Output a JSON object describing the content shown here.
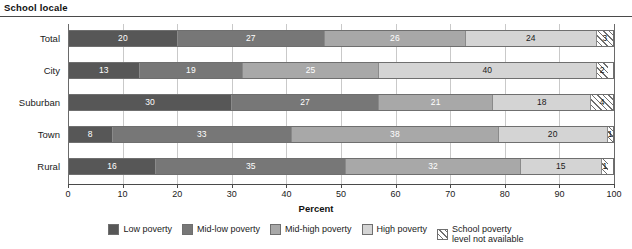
{
  "header": {
    "title": "School locale"
  },
  "chart_data": {
    "type": "bar",
    "orientation": "horizontal",
    "stacked": true,
    "stack_total": 100,
    "title": "School locale",
    "xlabel": "Percent",
    "ylabel": "",
    "xlim": [
      0,
      100
    ],
    "xticks": [
      "0",
      "10",
      "20",
      "30",
      "40",
      "50",
      "60",
      "70",
      "80",
      "90",
      "100"
    ],
    "grid": "vertical",
    "legend_position": "bottom",
    "categories": [
      "Total",
      "City",
      "Suburban",
      "Town",
      "Rural"
    ],
    "series": [
      {
        "name": "Low poverty",
        "color": "#575757",
        "values": [
          20,
          13,
          30,
          8,
          16
        ]
      },
      {
        "name": "Mid-low poverty",
        "color": "#777777",
        "values": [
          27,
          19,
          27,
          33,
          35
        ]
      },
      {
        "name": "Mid-high poverty",
        "color": "#a8a8a8",
        "values": [
          26,
          25,
          21,
          38,
          32
        ]
      },
      {
        "name": "High poverty",
        "color": "#d4d4d4",
        "values": [
          24,
          40,
          18,
          20,
          15
        ]
      },
      {
        "name": "School poverty level not available",
        "color": "#ffffff",
        "pattern": "diagonal-hatch",
        "values": [
          3,
          2,
          4,
          1,
          1
        ]
      }
    ],
    "rows": [
      {
        "label": "Total",
        "segments": [
          {
            "label": "20",
            "value": 20
          },
          {
            "label": "27",
            "value": 27
          },
          {
            "label": "26",
            "value": 26
          },
          {
            "label": "24",
            "value": 24
          },
          {
            "label": "3",
            "value": 3
          }
        ]
      },
      {
        "label": "City",
        "segments": [
          {
            "label": "13",
            "value": 13
          },
          {
            "label": "19",
            "value": 19
          },
          {
            "label": "25",
            "value": 25
          },
          {
            "label": "40",
            "value": 40
          },
          {
            "label": "2",
            "value": 2
          }
        ]
      },
      {
        "label": "Suburban",
        "segments": [
          {
            "label": "30",
            "value": 30
          },
          {
            "label": "27",
            "value": 27
          },
          {
            "label": "21",
            "value": 21
          },
          {
            "label": "18",
            "value": 18
          },
          {
            "label": "4",
            "value": 4
          }
        ]
      },
      {
        "label": "Town",
        "segments": [
          {
            "label": "8",
            "value": 8
          },
          {
            "label": "33",
            "value": 33
          },
          {
            "label": "38",
            "value": 38
          },
          {
            "label": "20",
            "value": 20
          },
          {
            "label": "1",
            "value": 1
          }
        ]
      },
      {
        "label": "Rural",
        "segments": [
          {
            "label": "16",
            "value": 16
          },
          {
            "label": "35",
            "value": 35
          },
          {
            "label": "32",
            "value": 32
          },
          {
            "label": "15",
            "value": 15
          },
          {
            "label": "1",
            "value": 1
          }
        ]
      }
    ],
    "legend": [
      {
        "label": "Low poverty"
      },
      {
        "label": "Mid-low poverty"
      },
      {
        "label": "Mid-high poverty"
      },
      {
        "label": "High poverty"
      },
      {
        "label": "School poverty\nlevel not available"
      }
    ]
  }
}
